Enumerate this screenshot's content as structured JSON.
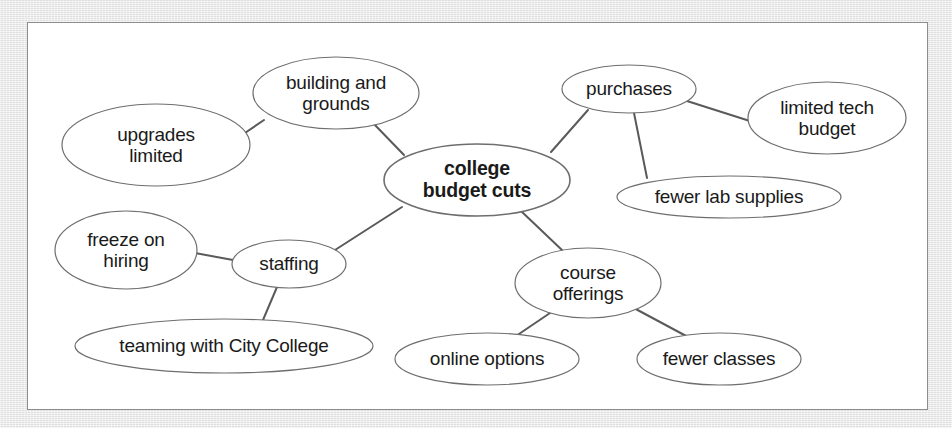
{
  "figure": {
    "type": "concept-map",
    "central_topic": "college budget cuts",
    "background_color": "#e8e8e8",
    "panel_color": "#ffffff",
    "border_color": "#8d8d8d",
    "node_fill": "#ffffff",
    "node_stroke": "#6e6e6e",
    "edge_color": "#5a5a5a",
    "text_color": "#1a1a1a"
  },
  "nodes": [
    {
      "id": "central",
      "label": "college\nbudget cuts",
      "level": 0,
      "bold": true,
      "cx": 477,
      "cy": 180,
      "rx": 93,
      "ry": 36
    },
    {
      "id": "building-and-grounds",
      "label": "building and\ngrounds",
      "level": 1,
      "bold": false,
      "cx": 336,
      "cy": 93,
      "rx": 83,
      "ry": 36
    },
    {
      "id": "upgrades-limited",
      "label": "upgrades\nlimited",
      "level": 2,
      "bold": false,
      "cx": 156,
      "cy": 145,
      "rx": 94,
      "ry": 41
    },
    {
      "id": "purchases",
      "label": "purchases",
      "level": 1,
      "bold": false,
      "cx": 629,
      "cy": 89,
      "rx": 67,
      "ry": 24
    },
    {
      "id": "limited-tech-budget",
      "label": "limited tech\nbudget",
      "level": 2,
      "bold": false,
      "cx": 827,
      "cy": 118,
      "rx": 79,
      "ry": 36
    },
    {
      "id": "fewer-lab-supplies",
      "label": "fewer lab supplies",
      "level": 2,
      "bold": false,
      "cx": 729,
      "cy": 197,
      "rx": 112,
      "ry": 21
    },
    {
      "id": "staffing",
      "label": "staffing",
      "level": 1,
      "bold": false,
      "cx": 289,
      "cy": 264,
      "rx": 57,
      "ry": 24
    },
    {
      "id": "freeze-on-hiring",
      "label": "freeze on\nhiring",
      "level": 2,
      "bold": false,
      "cx": 126,
      "cy": 250,
      "rx": 71,
      "ry": 39
    },
    {
      "id": "teaming-with-city-college",
      "label": "teaming with City College",
      "level": 2,
      "bold": false,
      "cx": 224,
      "cy": 346,
      "rx": 149,
      "ry": 27
    },
    {
      "id": "course-offerings",
      "label": "course\nofferings",
      "level": 1,
      "bold": false,
      "cx": 588,
      "cy": 283,
      "rx": 73,
      "ry": 35
    },
    {
      "id": "online-options",
      "label": "online options",
      "level": 2,
      "bold": false,
      "cx": 487,
      "cy": 359,
      "rx": 92,
      "ry": 26
    },
    {
      "id": "fewer-classes",
      "label": "fewer classes",
      "level": 2,
      "bold": false,
      "cx": 719,
      "cy": 359,
      "rx": 82,
      "ry": 26
    }
  ],
  "edges": [
    {
      "from": "central",
      "to": "building-and-grounds",
      "x1": 404,
      "y1": 155,
      "x2": 373,
      "y2": 123
    },
    {
      "from": "building-and-grounds",
      "to": "upgrades-limited",
      "x1": 264,
      "y1": 120,
      "x2": 239,
      "y2": 137
    },
    {
      "from": "central",
      "to": "purchases",
      "x1": 551,
      "y1": 152,
      "x2": 588,
      "y2": 110
    },
    {
      "from": "purchases",
      "to": "limited-tech-budget",
      "x1": 687,
      "y1": 101,
      "x2": 753,
      "y2": 122
    },
    {
      "from": "purchases",
      "to": "fewer-lab-supplies",
      "x1": 634,
      "y1": 113,
      "x2": 647,
      "y2": 178
    },
    {
      "from": "central",
      "to": "staffing",
      "x1": 402,
      "y1": 207,
      "x2": 335,
      "y2": 250
    },
    {
      "from": "staffing",
      "to": "freeze-on-hiring",
      "x1": 233,
      "y1": 260,
      "x2": 195,
      "y2": 253
    },
    {
      "from": "staffing",
      "to": "teaming-with-city-college",
      "x1": 277,
      "y1": 287,
      "x2": 263,
      "y2": 320
    },
    {
      "from": "central",
      "to": "course-offerings",
      "x1": 521,
      "y1": 211,
      "x2": 563,
      "y2": 251
    },
    {
      "from": "course-offerings",
      "to": "online-options",
      "x1": 553,
      "y1": 311,
      "x2": 516,
      "y2": 336
    },
    {
      "from": "course-offerings",
      "to": "fewer-classes",
      "x1": 632,
      "y1": 307,
      "x2": 688,
      "y2": 337
    }
  ]
}
